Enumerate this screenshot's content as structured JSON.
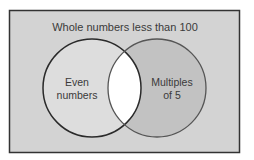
{
  "diagram": {
    "type": "venn",
    "title": "Whole numbers less than 100",
    "sets": [
      {
        "id": "left",
        "label_line1": "Even",
        "label_line2": "numbers"
      },
      {
        "id": "right",
        "label_line1": "Multiples",
        "label_line2": "of 5"
      }
    ],
    "colors": {
      "universe_fill": "#d3d3d3",
      "universe_border": "#333333",
      "left_fill": "#dddddd",
      "right_fill": "#c2c2c2",
      "intersection_fill": "#ffffff",
      "circle_stroke": "#2a2a2a"
    }
  }
}
